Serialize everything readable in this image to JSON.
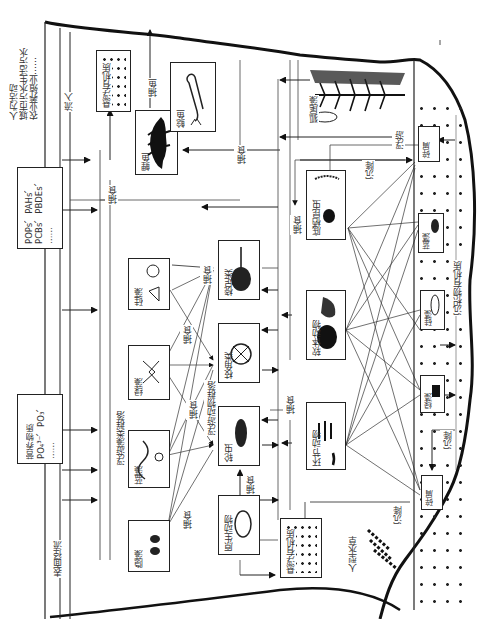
{
  "diagram": {
    "orientation": "rotated-90",
    "sources": {
      "human_activity": [
        "人为活动",
        "城市污水",
        "生活污水",
        "农业",
        "养殖业",
        "……"
      ],
      "input_label": "流入",
      "pollutants": [
        "POPs、PAHs、",
        "PCBs、PBDEs、",
        "……"
      ],
      "nutrients": [
        "营养物质",
        "PO₄³⁻、PO₃、",
        "……"
      ],
      "runoff": "表面径流"
    },
    "nodes": {
      "suspended_om_top": "悬浮有机质",
      "suspended_om_bottom": "悬浮有机质",
      "catfish": "鲶鱼",
      "carp": "鲤鱼",
      "myriophyllum": "狐尾藻",
      "benthic_insects": "底栖昆虫",
      "mollusks": "软体动物",
      "annelids": "环节动物",
      "copepods": "桡足类",
      "cladocera": "枝角类",
      "rotifers": "轮虫",
      "protozoa": "原生动物",
      "diatoms": "硅藻",
      "green_algae": "绿藻",
      "blue_algae": "蓝藻",
      "cryptophytes": "隐藻",
      "sediment_om": "沉积物有机质",
      "benthic_blue_algae": "蓝藻",
      "benthic_diatoms": "硅藻",
      "benthic_green_algae": "绿藻",
      "sediment_box_top": "碎屑",
      "sediment_box_bottom": "碎屑",
      "emergent_plants": "人型水草"
    },
    "groups": {
      "phytoplankton": "浮游藻类群落",
      "zooplankton": "浮游动物群落"
    },
    "edge_labels": {
      "fishing": "捕鱼",
      "predation": "捕食",
      "sedimentation": "沉降",
      "floating": "浮游"
    }
  }
}
